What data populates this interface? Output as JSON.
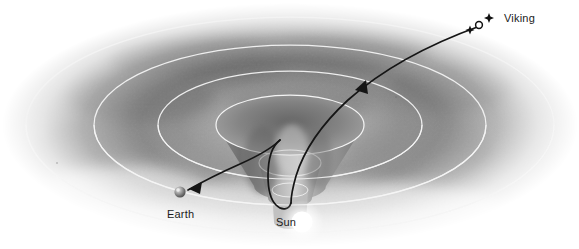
{
  "figure": {
    "kind": "gravity-well-illustration",
    "background_color": "#ffffff",
    "surface_color": "#9a9a9a",
    "ring_color": "#f2f2f2",
    "trajectory_color": "#151515",
    "sun_color": "#ffffff",
    "earth_color": "#8d8d8d",
    "label_color": "#1b1b1b"
  },
  "labels": {
    "viking": "Viking",
    "earth": "Earth",
    "sun": "Sun"
  },
  "bodies": [
    {
      "name": "sun",
      "label": "Sun",
      "x": 302,
      "y": 222,
      "radius": 11
    },
    {
      "name": "earth",
      "label": "Earth",
      "x": 180,
      "y": 192,
      "radius": 6
    },
    {
      "name": "viking",
      "label": "Viking",
      "x": 488,
      "y": 22,
      "radius": 4
    }
  ],
  "rings": [
    {
      "index": 1,
      "cx": 290,
      "cy": 125,
      "rx": 264,
      "ry": 108
    },
    {
      "index": 2,
      "cx": 290,
      "cy": 125,
      "rx": 196,
      "ry": 80
    },
    {
      "index": 3,
      "cx": 290,
      "cy": 125,
      "rx": 132,
      "ry": 54
    },
    {
      "index": 4,
      "cx": 290,
      "cy": 125,
      "rx": 74,
      "ry": 30
    }
  ],
  "annotations": {
    "arrowhead_near_earth": "arrow pointing toward Earth",
    "arrowhead_outbound": "arrow pointing sunward along Viking trajectory",
    "funnel": "central spacetime depression / gravity well"
  }
}
